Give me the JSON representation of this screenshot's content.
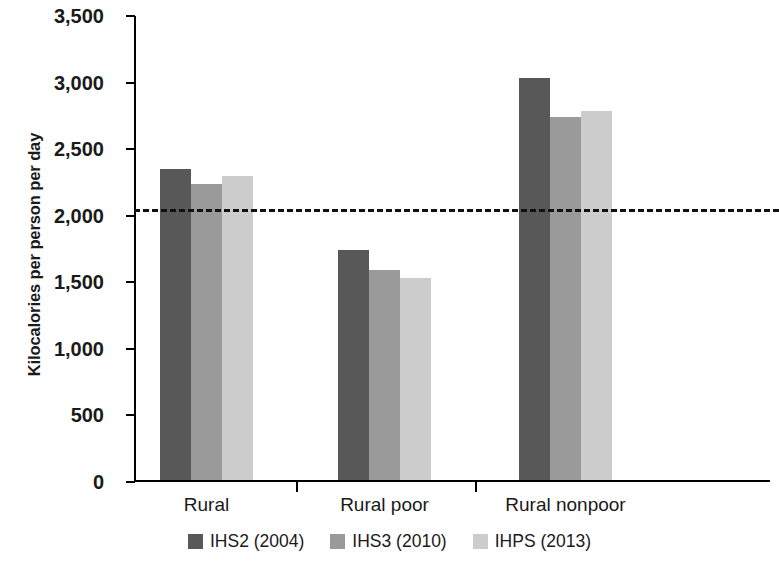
{
  "chart_data": {
    "type": "bar",
    "title": "",
    "xlabel": "",
    "ylabel": "Kilocalories per person per day",
    "categories": [
      "Rural",
      "Rural poor",
      "Rural nonpoor"
    ],
    "series": [
      {
        "name": "IHS2 (2004)",
        "color": "#585858",
        "values": [
          2335,
          1730,
          3020
        ]
      },
      {
        "name": "IHS3 (2010)",
        "color": "#9a9a9a",
        "values": [
          2220,
          1575,
          2725
        ]
      },
      {
        "name": "IHPS (2013)",
        "color": "#cccccc",
        "values": [
          2285,
          1520,
          2770
        ]
      }
    ],
    "ylim": [
      0,
      3500
    ],
    "yticks": [
      0,
      500,
      1000,
      1500,
      2000,
      2500,
      3000,
      3500
    ],
    "ytick_labels": [
      "0",
      "500",
      "1,000",
      "1,500",
      "2,000",
      "2,500",
      "3,000",
      "3,500"
    ],
    "grid": false,
    "legend_position": "bottom",
    "reference_line": {
      "value": 2050,
      "style": "dashed",
      "color": "#111111"
    }
  }
}
